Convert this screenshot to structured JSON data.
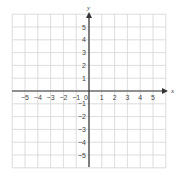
{
  "diagram": {
    "type": "coordinate-plane",
    "x_axis_label": "x",
    "y_axis_label": "y",
    "x_range": [
      -6,
      6
    ],
    "y_range": [
      -6,
      6
    ],
    "origin_label": "0",
    "x_tick_labels": [
      "−5",
      "−4",
      "−3",
      "−2",
      "−1",
      "1",
      "2",
      "3",
      "4",
      "5"
    ],
    "x_tick_values": [
      -5,
      -4,
      -3,
      -2,
      -1,
      1,
      2,
      3,
      4,
      5
    ],
    "y_tick_labels": [
      "5",
      "4",
      "3",
      "2",
      "1",
      "−1",
      "−2",
      "−3",
      "−4",
      "−5"
    ],
    "y_tick_values": [
      5,
      4,
      3,
      2,
      1,
      -1,
      -2,
      -3,
      -4,
      -5
    ],
    "grid": true,
    "colors": {
      "grid": "#d4d4d4",
      "axis": "#333333",
      "label": "#444444"
    }
  }
}
